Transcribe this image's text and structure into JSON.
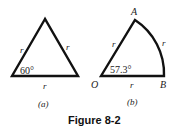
{
  "figure": {
    "caption": "Figure 8-2",
    "panel_a": {
      "label": "(a)",
      "side_left": "r",
      "side_right": "r",
      "side_bottom": "r",
      "angle": "60°"
    },
    "panel_b": {
      "label": "(b)",
      "vertex_A": "A",
      "vertex_O": "O",
      "vertex_B": "B",
      "side_OA": "r",
      "arc_AB": "r",
      "side_OB": "r",
      "angle": "57.3°"
    }
  }
}
